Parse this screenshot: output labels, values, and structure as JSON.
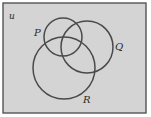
{
  "diagram": {
    "type": "venn",
    "universe": {
      "label": "u",
      "x": 3,
      "y": 3,
      "width": 143,
      "height": 110,
      "fill": "#d4d4d4",
      "stroke": "#555555"
    },
    "sets": [
      {
        "name": "P",
        "label": "P",
        "cx": 63,
        "cy": 37,
        "r": 19,
        "label_x": 34,
        "label_y": 36
      },
      {
        "name": "Q",
        "label": "Q",
        "cx": 87,
        "cy": 47,
        "r": 26,
        "label_x": 115,
        "label_y": 50
      },
      {
        "name": "R",
        "label": "R",
        "cx": 64,
        "cy": 68,
        "r": 31,
        "label_x": 83,
        "label_y": 103
      }
    ],
    "circle_stroke": "#4a4a4a"
  }
}
